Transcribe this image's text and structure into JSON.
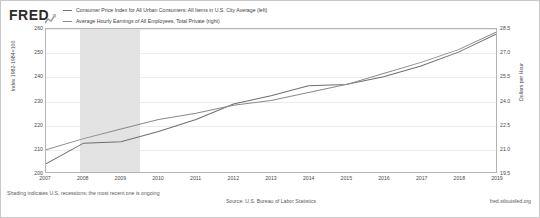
{
  "brand": {
    "logo_text": "FRED",
    "mark_icon": "mini-line-chart-icon"
  },
  "legend": {
    "entries": [
      {
        "label": "Consumer Price Index for All Urban Consumers: All Items in U.S. City Average (left)",
        "color": "#6f6f6f"
      },
      {
        "label": "Average Hourly Earnings of All Employees, Total Private (right)",
        "color": "#8a8a8a"
      }
    ]
  },
  "footer": {
    "note": "Shading indicates U.S. recessions; the most recent one is ongoing",
    "source": "Source: U.S. Bureau of Labor Statistics",
    "url": "fred.stlouisfed.org"
  },
  "chart_data": {
    "type": "line",
    "title": "",
    "xlabel": "",
    "ylabel": "Index 1982-1984=100",
    "y2label": "Dollars per Hour",
    "grid": true,
    "legend_position": "top",
    "x": [
      2007,
      2008,
      2009,
      2010,
      2011,
      2012,
      2013,
      2014,
      2015,
      2016,
      2017,
      2018,
      2019
    ],
    "xticklabels": [
      "2007",
      "2008",
      "2009",
      "2010",
      "2011",
      "2012",
      "2013",
      "2014",
      "2015",
      "2016",
      "2017",
      "2018",
      "2019"
    ],
    "ylim": [
      200,
      260
    ],
    "yticks": [
      200,
      210,
      220,
      230,
      240,
      250,
      260
    ],
    "yticklabels": [
      "200",
      "210",
      "220",
      "230",
      "240",
      "250",
      "260"
    ],
    "y2lim": [
      19.5,
      28.5
    ],
    "y2ticks": [
      19.5,
      21.0,
      22.5,
      24.0,
      25.5,
      27.0,
      28.5
    ],
    "y2ticklabels": [
      "19.5",
      "21.0",
      "22.5",
      "24.0",
      "25.5",
      "27.0",
      "28.5"
    ],
    "shaded_regions": [
      {
        "label": "U.S. recession",
        "x_start": 2007.9,
        "x_end": 2009.5,
        "color": "#e3e3e3"
      }
    ],
    "series": [
      {
        "name": "Consumer Price Index for All Urban Consumers: All Items in U.S. City Average (left)",
        "axis": "left",
        "color": "#6f6f6f",
        "values": [
          203.4,
          212.1,
          212.7,
          217.0,
          222.0,
          228.5,
          232.0,
          236.2,
          236.7,
          240.0,
          244.5,
          250.3,
          257.8
        ]
      },
      {
        "name": "Average Hourly Earnings of All Employees, Total Private (right)",
        "axis": "right",
        "color": "#8a8a8a",
        "values": [
          20.9,
          21.6,
          22.2,
          22.8,
          23.2,
          23.7,
          24.0,
          24.5,
          25.0,
          25.7,
          26.4,
          27.2,
          28.3
        ]
      }
    ]
  }
}
